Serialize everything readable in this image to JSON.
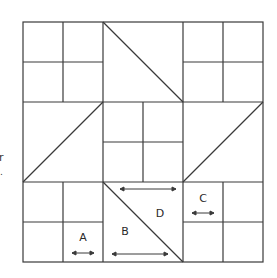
{
  "diagram": {
    "type": "quilt-block-layout",
    "grid": {
      "rows": 6,
      "cols": 6,
      "origin": [
        23,
        22
      ],
      "cell_size": 40
    },
    "stroke_color": "#3a3a3a",
    "blocks": [
      {
        "name": "top-left-four-patch",
        "row": 0,
        "col": 0,
        "kind": "four-patch"
      },
      {
        "name": "top-center-half-square",
        "row": 0,
        "col": 1,
        "kind": "half-square-triangle",
        "diagonal": "top-left-to-bottom-right"
      },
      {
        "name": "top-right-four-patch",
        "row": 0,
        "col": 2,
        "kind": "four-patch"
      },
      {
        "name": "middle-left-half-square",
        "row": 1,
        "col": 0,
        "kind": "half-square-triangle",
        "diagonal": "bottom-left-to-top-right"
      },
      {
        "name": "center-four-patch",
        "row": 1,
        "col": 1,
        "kind": "four-patch"
      },
      {
        "name": "middle-right-half-square",
        "row": 1,
        "col": 2,
        "kind": "half-square-triangle",
        "diagonal": "bottom-left-to-top-right"
      },
      {
        "name": "bottom-left-four-patch",
        "row": 2,
        "col": 0,
        "kind": "four-patch"
      },
      {
        "name": "bottom-center-half-square",
        "row": 2,
        "col": 1,
        "kind": "half-square-triangle",
        "diagonal": "top-left-to-bottom-right"
      },
      {
        "name": "bottom-right-four-patch",
        "row": 2,
        "col": 2,
        "kind": "four-patch"
      }
    ],
    "labels": [
      {
        "id": "A",
        "text": "A",
        "x": 83,
        "y": 241
      },
      {
        "id": "B",
        "text": "B",
        "x": 125,
        "y": 235
      },
      {
        "id": "C",
        "text": "C",
        "x": 203,
        "y": 202
      },
      {
        "id": "D",
        "text": "D",
        "x": 160,
        "y": 217
      }
    ],
    "grain_arrows": [
      {
        "for": "A",
        "x1": 72,
        "x2": 94,
        "y": 253
      },
      {
        "for": "B",
        "x1": 112,
        "x2": 168,
        "y": 254
      },
      {
        "for": "C",
        "x1": 192,
        "x2": 214,
        "y": 213
      },
      {
        "for": "D",
        "x1": 120,
        "x2": 176,
        "y": 189
      }
    ]
  },
  "edge_fragments": {
    "frag1": "r",
    "frag2": "."
  }
}
